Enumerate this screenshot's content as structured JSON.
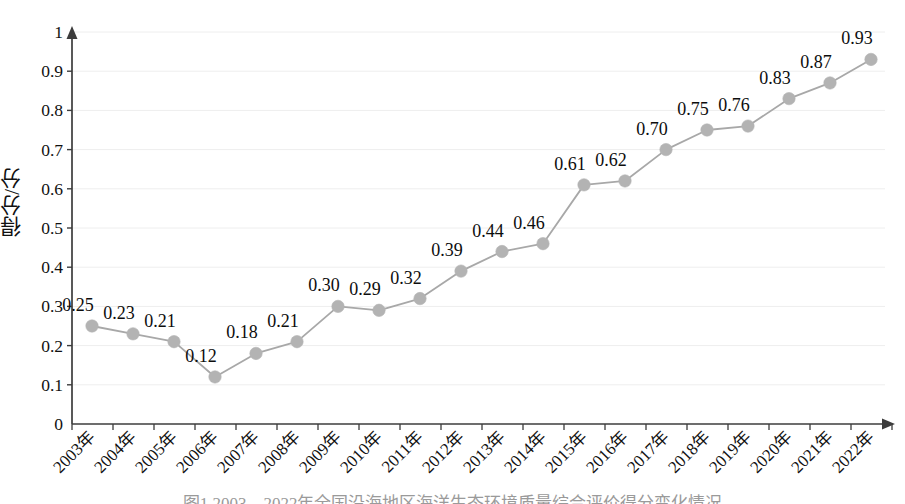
{
  "chart_data": {
    "type": "line",
    "title": "",
    "xlabel": "",
    "ylabel": "得分/分",
    "categories": [
      "2003年",
      "2004年",
      "2005年",
      "2006年",
      "2007年",
      "2008年",
      "2009年",
      "2010年",
      "2011年",
      "2012年",
      "2013年",
      "2014年",
      "2015年",
      "2016年",
      "2017年",
      "2018年",
      "2019年",
      "2020年",
      "2021年",
      "2022年"
    ],
    "values": [
      0.25,
      0.23,
      0.21,
      0.12,
      0.18,
      0.21,
      0.3,
      0.29,
      0.32,
      0.39,
      0.44,
      0.46,
      0.61,
      0.62,
      0.7,
      0.75,
      0.76,
      0.83,
      0.87,
      0.93
    ],
    "point_labels": [
      "0.25",
      "0.23",
      "0.21",
      "0.12",
      "0.18",
      "0.21",
      "0.30",
      "0.29",
      "0.32",
      "0.39",
      "0.44",
      "0.46",
      "0.61",
      "0.62",
      "0.70",
      "0.75",
      "0.76",
      "0.83",
      "0.87",
      "0.93"
    ],
    "ylim": [
      0,
      1
    ],
    "yticks": [
      0,
      0.1,
      0.2,
      0.3,
      0.4,
      0.5,
      0.6,
      0.7,
      0.8,
      0.9,
      1
    ],
    "ytick_labels": [
      "0",
      "0.1",
      "0.2",
      "0.3",
      "0.4",
      "0.5",
      "0.6",
      "0.7",
      "0.8",
      "0.9",
      "1"
    ],
    "grid": true,
    "legend": "none",
    "series_color": "#a8a8a8",
    "marker_color": "#b3b3b3",
    "axis_color": "#3c3c3c",
    "grid_color": "#eeeeee",
    "marker_shape": "circle",
    "x_axis_arrow": true,
    "y_axis_arrow": true,
    "xtick_rotation_deg": 45
  },
  "figure": {
    "caption": "图1  2003—2022年全国沿海地区海洋生态环境质量综合评价得分变化情况"
  }
}
